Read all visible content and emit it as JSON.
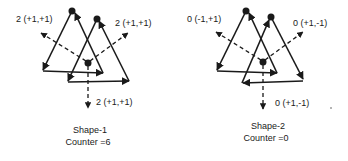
{
  "shapes": [
    {
      "name": "Shape-1",
      "caption": "Shape-1",
      "counter_label": "Counter =6",
      "labels": {
        "up_left": "2 (+1,+1)",
        "up_right": "2 (+1,+1)",
        "down": "2 (+1,+1)"
      }
    },
    {
      "name": "Shape-2",
      "caption": "Shape-2",
      "counter_label": "Counter =0",
      "labels": {
        "up_left": "0 (-1,+1)",
        "up_right": "0 (+1,-1)",
        "down": "0 (+1,-1)"
      }
    }
  ],
  "colors": {
    "ink": "#1a1a1a",
    "background": "#ffffff"
  }
}
